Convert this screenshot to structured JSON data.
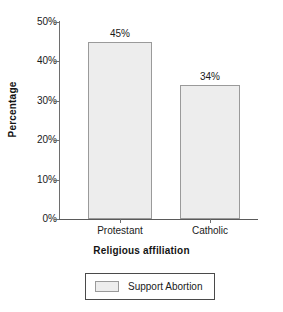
{
  "chart_data": {
    "type": "bar",
    "title": "",
    "categories": [
      "Protestant",
      "Catholic"
    ],
    "values": [
      45,
      34
    ],
    "data_labels": [
      "45%",
      "34%"
    ],
    "series": [
      {
        "name": "Support Abortion",
        "values": [
          45,
          34
        ]
      }
    ],
    "xlabel": "Religious affiliation",
    "ylabel": "Percentage",
    "ylim": [
      0,
      50
    ],
    "y_ticks": [
      50,
      40,
      30,
      20,
      10,
      0
    ],
    "y_tick_labels": [
      "50%",
      "40%",
      "30%",
      "20%",
      "10%",
      "0%"
    ],
    "grid": false,
    "legend_position": "bottom",
    "legend_entries": [
      "Support Abortion"
    ],
    "colors": {
      "bar_fill": "#ededed",
      "bar_border": "#9a9a9a",
      "axis": "#6e6e6e",
      "text": "#1a1a1a",
      "background": "#ffffff"
    }
  }
}
